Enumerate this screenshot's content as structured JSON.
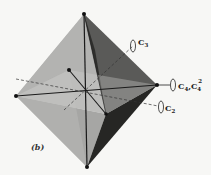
{
  "figure": {
    "label": "(b)"
  },
  "axes": [
    {
      "id": "c3",
      "label": "C3",
      "sub": "3"
    },
    {
      "id": "c4",
      "label": "C4,C4",
      "sup": "2"
    },
    {
      "id": "c2",
      "label": "C2",
      "sub": "2"
    }
  ],
  "labels": {
    "c3_main": "C",
    "c3_sub": "3",
    "c4_main": "C",
    "c4_sub": "4",
    "c4_sep": ",C",
    "c4_sub2": "4",
    "c4_sup": "2",
    "c2_main": "C",
    "c2_sub": "2"
  },
  "colors": {
    "background": "#f7f7f5",
    "edge": "#1a1a1a",
    "face_light": "#c9c9c7",
    "face_mid": "#a9a9a7",
    "face_dark": "#2a2a2a"
  }
}
